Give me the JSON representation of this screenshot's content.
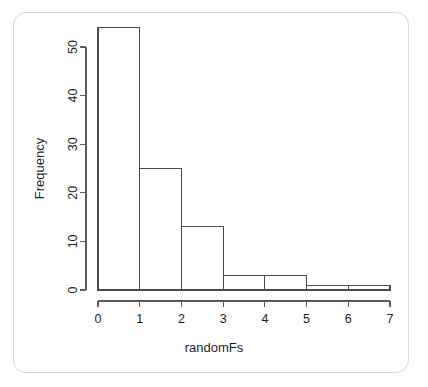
{
  "figure": {
    "card_border_color": "#d6d6d6",
    "background_color": "#ffffff",
    "stroke_color": "#4a4a4a"
  },
  "chart_data": {
    "type": "bar",
    "title": "",
    "subtitle": "",
    "xlabel": "randomFs",
    "ylabel": "Frequency",
    "categories": [
      "0-1",
      "1-2",
      "2-3",
      "3-4",
      "4-5",
      "5-6",
      "6-7"
    ],
    "bin_edges": [
      0,
      1,
      2,
      3,
      4,
      5,
      6,
      7
    ],
    "values": [
      54,
      25,
      13,
      3,
      3,
      1,
      1
    ],
    "xlim": [
      0,
      7
    ],
    "ylim": [
      0,
      54
    ],
    "x_ticks": [
      0,
      1,
      2,
      3,
      4,
      5,
      6,
      7
    ],
    "y_ticks": [
      0,
      10,
      20,
      30,
      40,
      50
    ],
    "x_tick_labels": [
      "0",
      "1",
      "2",
      "3",
      "4",
      "5",
      "6",
      "7"
    ],
    "y_tick_labels": [
      "0",
      "10",
      "20",
      "30",
      "40",
      "50"
    ],
    "grid": false,
    "legend": false,
    "legend_position": "none",
    "bar_fill": "none",
    "y_axis_label_rotation": -90,
    "y_tick_label_rotation": -90,
    "annotations": []
  }
}
